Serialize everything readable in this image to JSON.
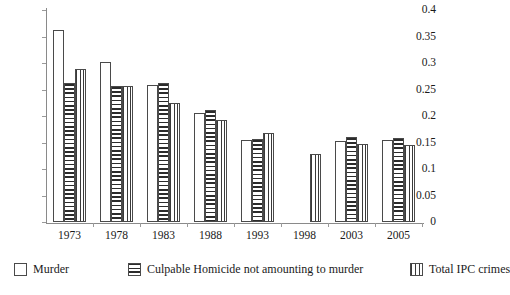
{
  "chart_data": {
    "type": "bar",
    "title": "",
    "xlabel": "",
    "ylabel": "",
    "ylim": [
      0,
      0.4
    ],
    "yticks": [
      "0",
      "0.05",
      "0.1",
      "0.15",
      "0.2",
      "0.25",
      "0.3",
      "0.35",
      "0.4"
    ],
    "ytick_values": [
      0,
      0.05,
      0.1,
      0.15,
      0.2,
      0.25,
      0.3,
      0.35,
      0.4
    ],
    "grid": false,
    "legend_position": "bottom",
    "categories": [
      "1973",
      "1978",
      "1983",
      "1988",
      "1993",
      "1998",
      "2003",
      "2005"
    ],
    "series": [
      {
        "name": "Murder",
        "pattern": "blank",
        "values": [
          0.363,
          0.302,
          0.259,
          0.205,
          0.155,
          null,
          0.152,
          0.154
        ]
      },
      {
        "name": "Culpable Homicide not amounting to murder",
        "pattern": "hstripe",
        "values": [
          0.262,
          0.256,
          0.262,
          0.211,
          0.156,
          null,
          0.16,
          0.158
        ]
      },
      {
        "name": "Total IPC crimes",
        "pattern": "vstripe",
        "values": [
          0.288,
          0.257,
          0.225,
          0.193,
          0.168,
          0.129,
          0.147,
          0.145
        ]
      }
    ]
  },
  "legend": {
    "items": [
      {
        "label": "Murder",
        "pattern": "blank"
      },
      {
        "label": "Culpable Homicide not amounting to murder",
        "pattern": "hstripe"
      },
      {
        "label": "Total IPC crimes",
        "pattern": "vstripe"
      }
    ]
  },
  "colors": {
    "axis": "#8a8a8a",
    "bar_outline": "#4a4a4a",
    "bar_fill": "#ffffff",
    "stripe": "#2b2b2b",
    "text": "#1a1a1a",
    "background": "#ffffff"
  }
}
